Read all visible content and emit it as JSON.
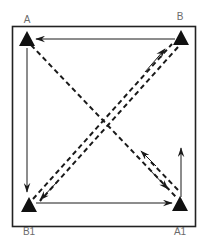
{
  "diagram": {
    "colors": {
      "line": "#1a1a1a",
      "border": "#222222",
      "label": "#6b6b6b",
      "background": "#ffffff"
    },
    "cones": [
      {
        "id": "A",
        "label": "A",
        "x": 27,
        "y": 40
      },
      {
        "id": "B",
        "label": "B",
        "x": 181,
        "y": 39
      },
      {
        "id": "B1",
        "label": "B1",
        "x": 29,
        "y": 206
      },
      {
        "id": "A1",
        "label": "A1",
        "x": 180,
        "y": 205
      }
    ],
    "labels": {
      "A": {
        "text": "A",
        "x": 27,
        "y": 15
      },
      "B": {
        "text": "B",
        "x": 180,
        "y": 12
      },
      "B1": {
        "text": "B1",
        "x": 29,
        "y": 227
      },
      "A1": {
        "text": "A1",
        "x": 180,
        "y": 227
      }
    },
    "paths": [
      {
        "from": "B",
        "to": "A",
        "style": "solid",
        "side": "top"
      },
      {
        "from": "A",
        "to": "B1",
        "style": "solid",
        "side": "left"
      },
      {
        "from": "B1",
        "to": "A1",
        "style": "solid",
        "side": "bottom"
      },
      {
        "from": "A1",
        "to": "up",
        "style": "solid",
        "side": "right"
      },
      {
        "from": "A",
        "to": "A1",
        "style": "dashed",
        "side": "diagonal"
      },
      {
        "from": "A1",
        "to": "A",
        "style": "dashed",
        "side": "diagonal-return"
      },
      {
        "from": "B1",
        "to": "B",
        "style": "dashed",
        "side": "diagonal"
      },
      {
        "from": "B",
        "to": "B1",
        "style": "dashed",
        "side": "diagonal-return"
      }
    ]
  }
}
